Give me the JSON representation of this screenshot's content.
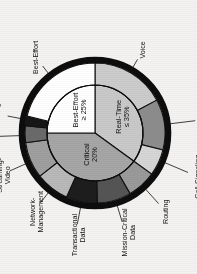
{
  "figure": {
    "title": "",
    "orientation_note": "rotated-90-ccw"
  },
  "chart_data": {
    "type": "pie",
    "title": "",
    "subtitle": "",
    "xlabel": "",
    "ylabel": "",
    "legend_position": "none",
    "grid": false,
    "rotation_deg": -90,
    "rings": [
      {
        "name": "inner",
        "slices": [
          {
            "label": "Real-Time",
            "value_label": "≤ 35%",
            "value": 35,
            "color": "#c9c9c9",
            "start_deg": 0,
            "end_deg": 126
          },
          {
            "label": "Critical",
            "value_label": "20%",
            "value": 20,
            "color": "#a6a6a6",
            "start_deg": 126,
            "end_deg": 270
          },
          {
            "label": "Best-Effort",
            "value_label": "≥ 25%",
            "value": 25,
            "color": "#ffffff",
            "start_deg": 270,
            "end_deg": 360
          }
        ]
      },
      {
        "name": "outer",
        "slices": [
          {
            "label": "Voice",
            "color": "#cccccc",
            "start_deg": 0,
            "end_deg": 62,
            "parent": "Real-Time"
          },
          {
            "label": "Interactive-Video",
            "color": "#8d8d8d",
            "start_deg": 62,
            "end_deg": 104,
            "parent": "Real-Time"
          },
          {
            "label": "Call-Signaling",
            "color": "#d6d6d6",
            "start_deg": 104,
            "end_deg": 126,
            "parent": "Real-Time"
          },
          {
            "label": "Routing",
            "color": "#9a9a9a",
            "start_deg": 126,
            "end_deg": 150,
            "parent": "Critical"
          },
          {
            "label": "Mission-Critical Data",
            "color": "#555555",
            "start_deg": 150,
            "end_deg": 178,
            "parent": "Critical"
          },
          {
            "label": "Transactional Data",
            "color": "#1d1d1d",
            "start_deg": 178,
            "end_deg": 204,
            "parent": "Critical"
          },
          {
            "label": "Network-Management",
            "color": "#b9b9b9",
            "start_deg": 204,
            "end_deg": 232,
            "parent": "Critical"
          },
          {
            "label": "Streaming-Video",
            "color": "#9f9f9f",
            "start_deg": 232,
            "end_deg": 262,
            "parent": "Critical"
          },
          {
            "label": "Bulk Data",
            "color": "#6a6a6a",
            "start_deg": 262,
            "end_deg": 276,
            "parent": "Best-Effort"
          },
          {
            "label": "Scavenger",
            "color": "#161616",
            "start_deg": 276,
            "end_deg": 284,
            "parent": "Best-Effort"
          },
          {
            "label": "Best-Effort",
            "color": "#ffffff",
            "start_deg": 284,
            "end_deg": 360,
            "parent": "Best-Effort"
          }
        ]
      }
    ],
    "inner_labels": [
      {
        "name": "real-time",
        "line1": "Real-Time",
        "line2": "≤ 35%"
      },
      {
        "name": "critical",
        "line1": "Critical",
        "line2": "20%"
      },
      {
        "name": "best-effort",
        "line1": "Best-Effort",
        "line2": "≥ 25%"
      }
    ],
    "outer_labels": [
      {
        "name": "voice",
        "text": "Voice"
      },
      {
        "name": "interactive-video",
        "line1": "Interactive-",
        "line2": "Video"
      },
      {
        "name": "call-signaling",
        "text": "Call-Signaling"
      },
      {
        "name": "routing",
        "text": "Routing"
      },
      {
        "name": "mission-critical-data",
        "line1": "Mission-Critical",
        "line2": "Data"
      },
      {
        "name": "transactional-data",
        "line1": "Transactional",
        "line2": "Data"
      },
      {
        "name": "network-management",
        "line1": "Network-",
        "line2": "Management"
      },
      {
        "name": "streaming-video",
        "line1": "Streaming-",
        "line2": "Video"
      },
      {
        "name": "bulk-data",
        "text": "Bulk Data"
      },
      {
        "name": "scavenger",
        "text": "Scavenger"
      },
      {
        "name": "best-effort-outer",
        "text": "Best-Effort"
      }
    ],
    "colors": {
      "border_ring": "#0d0d0d",
      "background": "#f4f3f1",
      "text": "#141414"
    }
  }
}
